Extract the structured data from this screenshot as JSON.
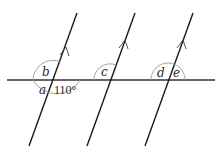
{
  "diagram": {
    "transversal": {
      "x1": 7,
      "y1": 80,
      "x2": 215,
      "y2": 80
    },
    "parallel_lines": [
      {
        "id": "line-1",
        "x1": 77,
        "y1": 13,
        "x2": 29,
        "y2": 146,
        "arrow_y": 52
      },
      {
        "id": "line-2",
        "x1": 135,
        "y1": 13,
        "x2": 87,
        "y2": 146,
        "arrow_y": 45
      },
      {
        "id": "line-3",
        "x1": 193,
        "y1": 13,
        "x2": 145,
        "y2": 146,
        "arrow_y": 45
      }
    ],
    "angle_labels": {
      "a": "a",
      "b": "b",
      "given": "110°",
      "c": "c",
      "d": "d",
      "e": "e"
    },
    "colors": {
      "line": "#1a1a1a",
      "transversal": "#333333",
      "arc": "#9a9a9a"
    }
  }
}
